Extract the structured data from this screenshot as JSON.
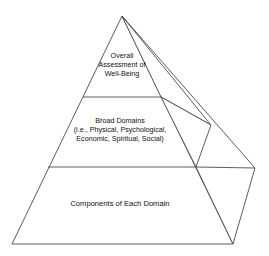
{
  "figure": {
    "type": "pyramid-hierarchy-diagram",
    "background_color": "#ffffff",
    "line_color": "#4a4a4a",
    "text_color": "#111111"
  },
  "pyramid": {
    "tiers": [
      {
        "id": "top",
        "name": "overall-assessment",
        "lines": [
          "Overall",
          "Assessment of",
          "Well-Being"
        ],
        "text": "Overall\nAssessment of\nWell-Being"
      },
      {
        "id": "middle",
        "name": "broad-domains",
        "lines": [
          "Broad Domains",
          "(i.e., Physical, Psychological,",
          "Economic, Spiritual, Social)"
        ],
        "text": "Broad Domains\n(i.e., Physical, Psychological,\nEconomic, Spiritual, Social)"
      },
      {
        "id": "bottom",
        "name": "components",
        "lines": [
          "Components of Each Domain"
        ],
        "text": "Components of Each Domain"
      }
    ]
  },
  "geometry": {
    "apex": [
      122,
      16
    ],
    "front_left_base": [
      12,
      244
    ],
    "front_right_base": [
      233,
      244
    ],
    "right_far_vertex": [
      255,
      168
    ],
    "divider_top": {
      "x1": 83,
      "y1": 97,
      "x2": 161,
      "y2": 97
    },
    "divider_middle": {
      "x1": 48,
      "y1": 167,
      "x2": 196,
      "y2": 167
    },
    "side_vertex_upper": [
      211,
      125
    ],
    "side_vertex_lower": [
      196,
      167
    ]
  }
}
